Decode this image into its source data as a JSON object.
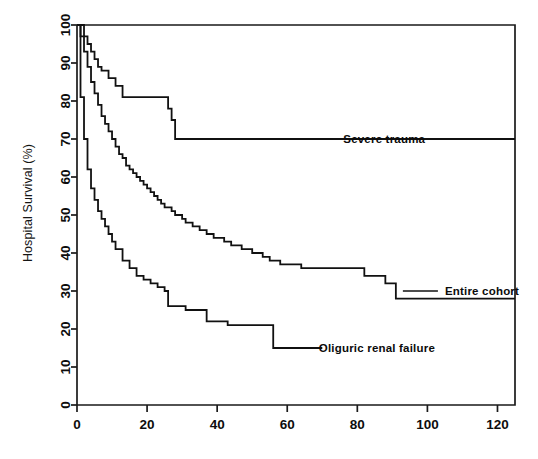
{
  "chart_data": {
    "type": "line",
    "title": "",
    "subtitle": "",
    "xlabel": "",
    "ylabel": "Hospital Survival (%)",
    "xlim": [
      0,
      125
    ],
    "ylim": [
      0,
      100
    ],
    "xticks": [
      0,
      20,
      40,
      60,
      80,
      100,
      120
    ],
    "yticks": [
      0,
      10,
      20,
      30,
      40,
      50,
      60,
      70,
      80,
      90,
      100
    ],
    "grid": false,
    "legend_position": "inline-annotations",
    "line_color": "#111111",
    "step_style": "post",
    "annotations": [
      {
        "text": "Severe trauma",
        "x": 76,
        "y": 70,
        "leader_from_x": 52,
        "leader_to_x": 73
      },
      {
        "text": "Entire cohort",
        "x": 105,
        "y": 30,
        "leader_from_x": 93,
        "leader_to_x": 103
      },
      {
        "text": "Oliguric renal failure",
        "x": 69,
        "y": 15,
        "leader_from_x": 58,
        "leader_to_x": 67
      }
    ],
    "series": [
      {
        "name": "Severe trauma",
        "label": "Severe trauma",
        "final_value": 70,
        "x": [
          0,
          1,
          2,
          3,
          4,
          5,
          6,
          7,
          9,
          11,
          13,
          25,
          26,
          27,
          28,
          125
        ],
        "y": [
          100,
          100,
          97,
          95,
          93,
          91,
          89,
          88,
          86,
          84,
          81,
          81,
          78,
          75,
          70,
          70
        ]
      },
      {
        "name": "Entire cohort",
        "label": "Entire cohort",
        "final_value": 28,
        "x": [
          0,
          1,
          2,
          3,
          4,
          5,
          6,
          7,
          8,
          9,
          10,
          11,
          12,
          13,
          14,
          15,
          16,
          17,
          18,
          19,
          20,
          21,
          22,
          23,
          24,
          25,
          26,
          27,
          28,
          29,
          30,
          31,
          32,
          33,
          34,
          35,
          36,
          37,
          38,
          39,
          40,
          41,
          42,
          43,
          44,
          45,
          46,
          47,
          48,
          49,
          50,
          51,
          52,
          53,
          54,
          55,
          56,
          57,
          58,
          60,
          62,
          64,
          74,
          82,
          88,
          91,
          125
        ],
        "y": [
          100,
          97,
          93,
          89,
          85,
          82,
          79,
          76,
          74,
          72,
          70,
          68,
          66,
          65,
          63,
          62,
          61,
          60,
          59,
          58,
          57,
          56,
          55,
          54,
          53,
          52,
          52,
          51,
          50,
          50,
          49,
          48,
          48,
          47,
          47,
          46,
          46,
          45,
          45,
          44,
          44,
          44,
          43,
          43,
          42,
          42,
          42,
          41,
          41,
          41,
          40,
          40,
          40,
          39,
          39,
          38,
          38,
          38,
          37,
          37,
          37,
          36,
          36,
          34,
          32,
          28,
          28
        ]
      },
      {
        "name": "Oliguric renal failure",
        "label": "Oliguric renal failure",
        "final_value": 15,
        "x": [
          0,
          1,
          2,
          3,
          4,
          5,
          6,
          7,
          8,
          9,
          10,
          11,
          13,
          15,
          17,
          19,
          21,
          23,
          25,
          26,
          28,
          31,
          34,
          37,
          40,
          43,
          46,
          50,
          53,
          56,
          58,
          70
        ],
        "y": [
          100,
          81,
          70,
          62,
          57,
          54,
          51,
          49,
          47,
          45,
          43,
          41,
          38,
          36,
          34,
          33,
          32,
          31,
          30,
          26,
          26,
          25,
          25,
          22,
          22,
          21,
          21,
          21,
          21,
          15,
          15,
          15
        ]
      }
    ]
  },
  "axis": {
    "y_title": "Hospital Survival (%)",
    "x_tick_labels": [
      "0",
      "20",
      "40",
      "60",
      "80",
      "100",
      "120"
    ],
    "y_tick_labels": [
      "0",
      "10",
      "20",
      "30",
      "40",
      "50",
      "60",
      "70",
      "80",
      "90",
      "100"
    ]
  },
  "labels": {
    "severe_trauma": "Severe trauma",
    "entire_cohort": "Entire cohort",
    "oliguric_renal_failure": "Oliguric renal failure"
  }
}
